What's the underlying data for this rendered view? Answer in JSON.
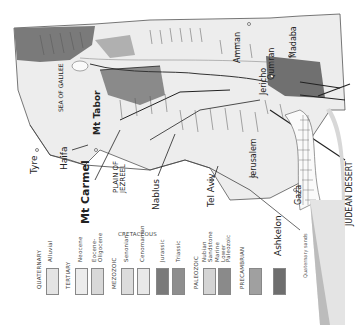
{
  "map": {
    "title": "Geological map of Palestine (rotated)",
    "places": [
      {
        "name": "Tyre",
        "x": 33,
        "y": 155,
        "size": 9
      },
      {
        "name": "Haifa",
        "x": 62,
        "y": 165,
        "size": 9
      },
      {
        "name": "Mt Carmel",
        "x": 84,
        "y": 190,
        "size": 11,
        "bold": true
      },
      {
        "name": "Mt Tabor",
        "x": 94,
        "y": 130,
        "size": 9,
        "bold": true
      },
      {
        "name": "SEA OF GALILEE",
        "x": 62,
        "y": 105,
        "size": 6
      },
      {
        "name": "PLAIN OF JEZREEL",
        "x": 117,
        "y": 170,
        "size": 7
      },
      {
        "name": "Nablus",
        "x": 155,
        "y": 185,
        "size": 9
      },
      {
        "name": "Tel Aviv",
        "x": 210,
        "y": 176,
        "size": 9
      },
      {
        "name": "Jerusalem",
        "x": 253,
        "y": 138,
        "size": 8
      },
      {
        "name": "Jericho",
        "x": 265,
        "y": 88,
        "size": 8
      },
      {
        "name": "Amman",
        "x": 237,
        "y": 60,
        "size": 8
      },
      {
        "name": "Qumran",
        "x": 272,
        "y": 52,
        "size": 8
      },
      {
        "name": "Madaba",
        "x": 291,
        "y": 42,
        "size": 8
      },
      {
        "name": "Gaza",
        "x": 298,
        "y": 186,
        "size": 8
      },
      {
        "name": "Ashkelon",
        "x": 278,
        "y": 215,
        "size": 9
      },
      {
        "name": "JUDEAN DESERT",
        "x": 340,
        "y": 160,
        "size": 8
      },
      {
        "name": "Quaternary sands",
        "x": 305,
        "y": 265,
        "size": 5
      }
    ]
  },
  "legend": {
    "groups": [
      {
        "label": "QUATERNARY",
        "x": 36
      },
      {
        "label": "TERTIARY",
        "x": 66
      },
      {
        "label": "MEZOZOIC",
        "x": 113
      },
      {
        "label": "CRETACEOUS",
        "x": 118,
        "y": 231
      },
      {
        "label": "PALEOZOIC",
        "x": 195
      },
      {
        "label": "PRECAMBRIAN",
        "x": 241
      }
    ],
    "items": [
      {
        "label": "Alluvial",
        "x": 46,
        "color": "#e4e4e4"
      },
      {
        "label": "Neocene",
        "x": 75,
        "color": "#ececec"
      },
      {
        "label": "Eocene-Oligocene",
        "x": 91,
        "color": "#d8d8d8"
      },
      {
        "label": "Senonian",
        "x": 121,
        "color": "#dcdcdc"
      },
      {
        "label": "Cenomanian",
        "x": 137,
        "color": "#e8e8e8"
      },
      {
        "label": "Jurassic",
        "x": 156,
        "color": "#7a7a7a"
      },
      {
        "label": "Triassic",
        "x": 172,
        "color": "#8e8e8e"
      },
      {
        "label": "Nubian Sandstone",
        "x": 203,
        "color": "#d4d4d4"
      },
      {
        "label": "Marine Lower Paleozoic",
        "x": 218,
        "color": "#8a8a8a"
      },
      {
        "label": "",
        "x": 249,
        "color": "#a0a0a0"
      },
      {
        "label": "",
        "x": 273,
        "color": "#6e6e6e"
      }
    ]
  }
}
